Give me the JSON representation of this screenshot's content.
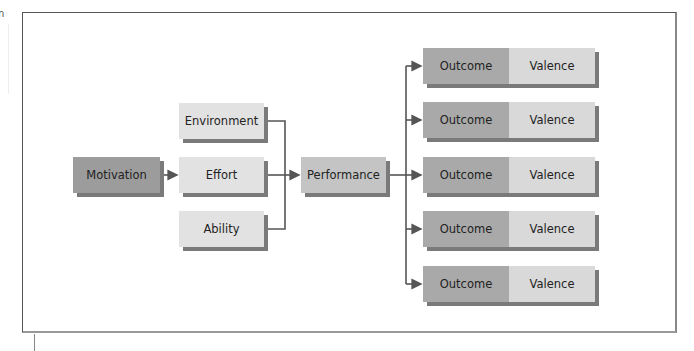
{
  "crop_fragment": "n",
  "diagram": {
    "type": "expectancy-theory-flow",
    "nodes": {
      "motivation": "Motivation",
      "environment": "Environment",
      "effort": "Effort",
      "ability": "Ability",
      "performance": "Performance"
    },
    "outcomes": [
      {
        "outcome": "Outcome",
        "valence": "Valence"
      },
      {
        "outcome": "Outcome",
        "valence": "Valence"
      },
      {
        "outcome": "Outcome",
        "valence": "Valence"
      },
      {
        "outcome": "Outcome",
        "valence": "Valence"
      },
      {
        "outcome": "Outcome",
        "valence": "Valence"
      }
    ],
    "edges": [
      [
        "Motivation",
        "Effort"
      ],
      [
        "Environment",
        "Performance"
      ],
      [
        "Effort",
        "Performance"
      ],
      [
        "Ability",
        "Performance"
      ],
      [
        "Performance",
        "Outcome 1"
      ],
      [
        "Performance",
        "Outcome 2"
      ],
      [
        "Performance",
        "Outcome 3"
      ],
      [
        "Performance",
        "Outcome 4"
      ],
      [
        "Performance",
        "Outcome 5"
      ]
    ],
    "colors": {
      "dark_box": "#9c9c9c",
      "light_box": "#e2e2e2",
      "mid_box": "#c4c4c4",
      "outcome": "#a9a9a9",
      "valence": "#d9d9d9",
      "line": "#555555"
    }
  }
}
